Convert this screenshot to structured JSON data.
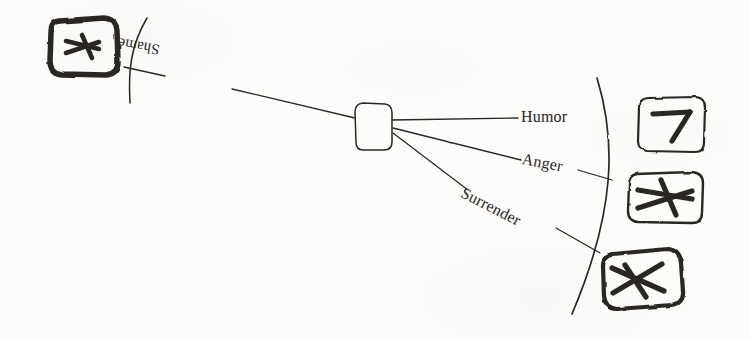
{
  "diagram": {
    "type": "hand-drawn concept map",
    "medium": "ink on paper",
    "background_color": "#fcfcfb",
    "ink_color": "#2a2724",
    "center_node": {
      "name": "center-node",
      "label": "",
      "shape": "rounded-rectangle"
    },
    "branches": [
      {
        "id": "shame",
        "label": "Shame",
        "direction": "left",
        "label_rotation_deg": 190,
        "target_box": "box-left"
      },
      {
        "id": "humor",
        "label": "Humor",
        "direction": "right",
        "label_rotation_deg": 0,
        "target_box": "box-right-top"
      },
      {
        "id": "anger",
        "label": "Anger",
        "direction": "right",
        "label_rotation_deg": 11,
        "target_box": "box-right-middle"
      },
      {
        "id": "surrender",
        "label": "Surrender",
        "direction": "right",
        "label_rotation_deg": 27,
        "target_box": "box-right-bottom"
      }
    ],
    "boxes": [
      {
        "id": "box-left",
        "glyph_name": "crossed-arrow-glyph",
        "glyph_description": "thick hand-drawn arrow crossed by a slash",
        "border_style": "thick irregular",
        "side": "left"
      },
      {
        "id": "box-right-top",
        "glyph_name": "bent-arrow-glyph",
        "glyph_description": "thick hand-drawn seven-like bent arrow",
        "border_style": "thin irregular",
        "side": "right"
      },
      {
        "id": "box-right-middle",
        "glyph_name": "crossed-arrow-glyph",
        "glyph_description": "thick hand-drawn arrow crossed by a slash",
        "border_style": "thin irregular",
        "side": "right"
      },
      {
        "id": "box-right-bottom",
        "glyph_name": "barred-arrow-glyph",
        "glyph_description": "thick hand-drawn arrow with crossbar, tilted",
        "border_style": "thick irregular",
        "side": "right"
      }
    ],
    "arcs": [
      {
        "id": "arc-left",
        "name": "left-boundary-arc",
        "bulge": "left"
      },
      {
        "id": "arc-right",
        "name": "right-boundary-arc",
        "bulge": "right"
      }
    ]
  }
}
